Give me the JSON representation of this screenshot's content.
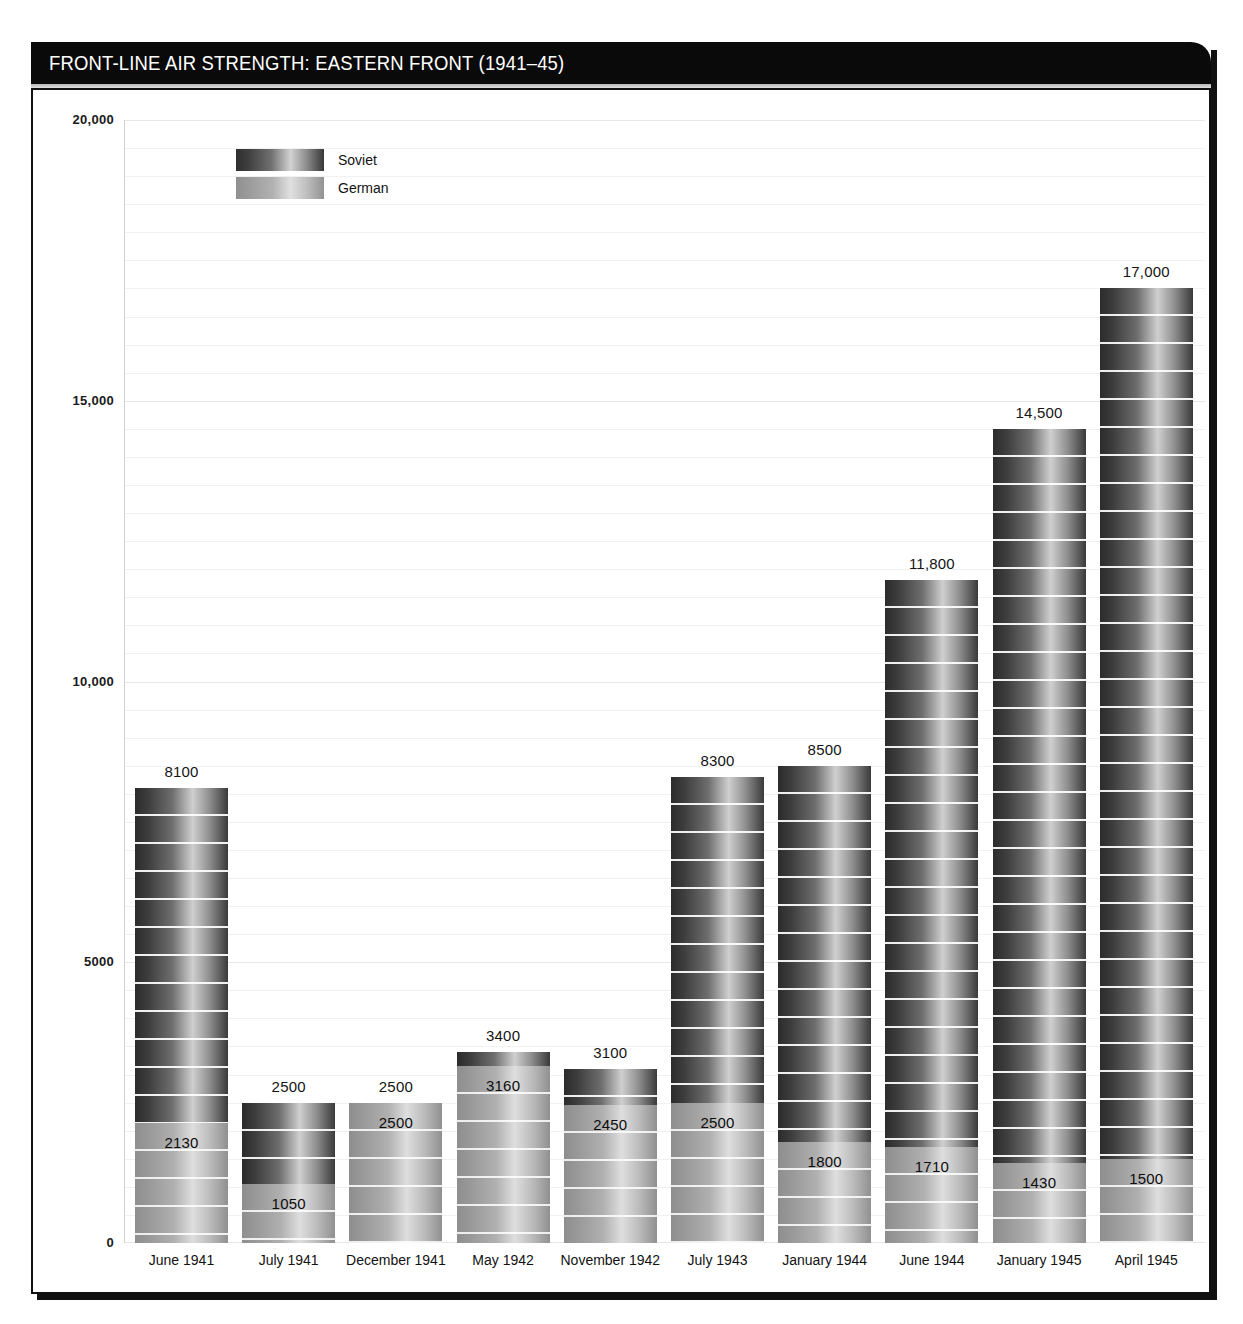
{
  "header": {
    "title": "FRONT-LINE AIR STRENGTH: EASTERN FRONT (1941–45)"
  },
  "legend": {
    "position": "top-left-inside",
    "items": [
      {
        "label": "Soviet",
        "swatch": "soviet-gradient-dark"
      },
      {
        "label": "German",
        "swatch": "german-gradient-light"
      }
    ]
  },
  "chart_data": {
    "type": "bar",
    "title": "FRONT-LINE AIR STRENGTH: EASTERN FRONT (1941–45)",
    "xlabel": "",
    "ylabel": "",
    "ylim": [
      0,
      20000
    ],
    "grid": true,
    "grid_major_step": 5000,
    "grid_minor_step": 500,
    "legend_entries": [
      "Soviet",
      "German"
    ],
    "ytick_labels": [
      "0",
      "5000",
      "10,000",
      "15,000",
      "20,000"
    ],
    "ytick_values": [
      0,
      5000,
      10000,
      15000,
      20000
    ],
    "categories": [
      "June 1941",
      "July 1941",
      "December 1941",
      "May 1942",
      "November 1942",
      "July 1943",
      "January 1944",
      "June 1944",
      "January 1945",
      "April 1945"
    ],
    "series": [
      {
        "name": "Soviet",
        "values": [
          8100,
          2500,
          2500,
          3400,
          3100,
          8300,
          8500,
          11800,
          14500,
          17000
        ],
        "labels": [
          "8100",
          "2500",
          "2500",
          "3400",
          "3100",
          "8300",
          "8500",
          "11,800",
          "14,500",
          "17,000"
        ]
      },
      {
        "name": "German",
        "values": [
          2130,
          1050,
          2500,
          3160,
          2450,
          2500,
          1800,
          1710,
          1430,
          1500
        ],
        "labels": [
          "2130",
          "1050",
          "2500",
          "3160",
          "2450",
          "2500",
          "1800",
          "1710",
          "1430",
          "1500"
        ]
      }
    ]
  },
  "colors": {
    "title_bar": "#0a0a0a",
    "title_text": "#ffffff",
    "frame": "#111111",
    "grid": "#f1f1f1",
    "soviet_dark": "#2f2f2f",
    "soviet_light": "#d2d2d2",
    "german_dark": "#909090",
    "german_light": "#e0e0e0",
    "text": "#121212"
  }
}
